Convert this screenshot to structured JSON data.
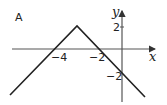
{
  "figure": {
    "label": "A",
    "x_axis_label": "x",
    "y_axis_label": "y",
    "x_ticks": [
      {
        "label": "−4",
        "value": -4
      },
      {
        "label": "−2",
        "value": -2
      }
    ],
    "y_ticks": [
      {
        "label": "2",
        "value": 2
      },
      {
        "label": "−2",
        "value": -2
      }
    ],
    "graph": {
      "type": "inverted-V (absolute value shape)",
      "vertex": [
        -3,
        2
      ],
      "x_intercepts": [
        -4,
        -2
      ],
      "y_intercept": -2
    },
    "colors": {
      "line": "#222222",
      "axis": "#333333",
      "background": "#ffffff"
    }
  }
}
